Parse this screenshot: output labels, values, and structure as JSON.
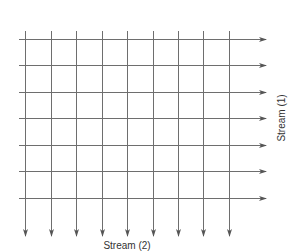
{
  "diagram": {
    "line_color": "#6e6e6e",
    "stream1": {
      "label": "Stream (1)",
      "direction": "left-to-right",
      "count": 7,
      "y_positions": [
        39,
        65,
        92,
        118,
        145,
        171,
        198
      ],
      "x_start": 19,
      "x_end": 266
    },
    "stream2": {
      "label": "Stream (2)",
      "direction": "top-to-bottom",
      "count": 9,
      "x_positions": [
        25,
        51,
        76,
        102,
        127,
        153,
        178,
        203,
        229
      ],
      "y_start": 31,
      "y_end": 236
    }
  }
}
